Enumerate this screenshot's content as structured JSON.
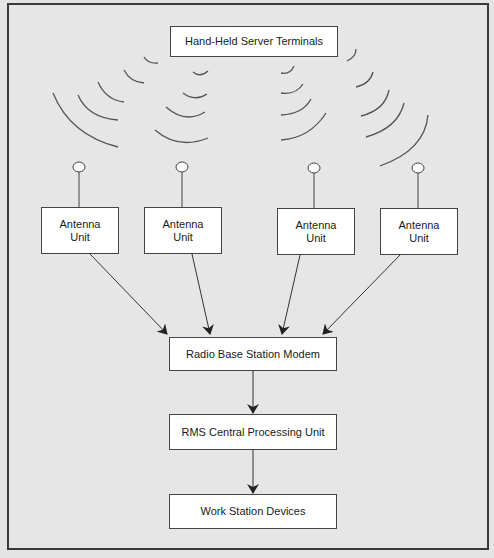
{
  "diagram": {
    "title_node": "Hand-Held Server Terminals",
    "antenna_units": [
      {
        "line1": "Antenna",
        "line2": "Unit"
      },
      {
        "line1": "Antenna",
        "line2": "Unit"
      },
      {
        "line1": "Antenna",
        "line2": "Unit"
      },
      {
        "line1": "Antenna",
        "line2": "Unit"
      }
    ],
    "radio_base_station": "Radio Base Station Modem",
    "rms_cpu": "RMS Central Processing Unit",
    "work_station": "Work Station Devices",
    "flow": [
      "Hand-Held Server Terminals -> (radio waves) -> Antenna Unit x4",
      "Antenna Unit x4 -> Radio Base Station Modem",
      "Radio Base Station Modem -> RMS Central Processing Unit",
      "RMS Central Processing Unit -> Work Station Devices"
    ],
    "colors": {
      "background": "#e6e6e6",
      "box_fill": "#ffffff",
      "stroke": "#444444"
    }
  }
}
